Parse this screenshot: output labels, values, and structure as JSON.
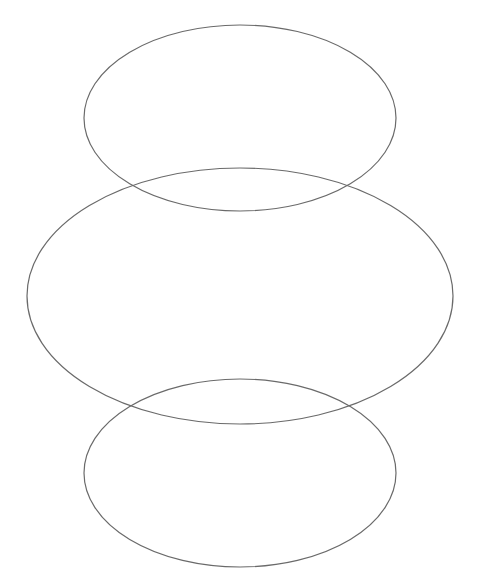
{
  "canvas": {
    "width": 482,
    "height": 588,
    "background": "#ffffff"
  },
  "stroke": {
    "color": "#6a6a6a",
    "width": 1.2
  },
  "shapes": [
    {
      "name": "top-ellipse",
      "cx": 240,
      "cy": 118,
      "rx": 156,
      "ry": 93
    },
    {
      "name": "middle-ellipse",
      "cx": 240,
      "cy": 296,
      "rx": 213,
      "ry": 128
    },
    {
      "name": "bottom-ellipse",
      "cx": 240,
      "cy": 473,
      "rx": 156,
      "ry": 94
    }
  ]
}
